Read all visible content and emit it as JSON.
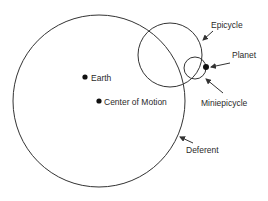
{
  "diagram": {
    "colors": {
      "line": "#333333",
      "dot": "#111111",
      "text": "#2a2a2a",
      "background": "#ffffff"
    },
    "circles": [
      {
        "name": "Deferent",
        "cx": 99,
        "cy": 101,
        "r": 86
      },
      {
        "name": "Epicycle",
        "cx": 170,
        "cy": 55,
        "r": 32
      },
      {
        "name": "Miniepicycle",
        "cx": 195,
        "cy": 68,
        "r": 11
      }
    ],
    "points": [
      {
        "name": "Earth",
        "x": 85,
        "y": 77,
        "label": "Earth"
      },
      {
        "name": "Center of Motion",
        "x": 99,
        "y": 101,
        "label": "Center of Motion"
      },
      {
        "name": "Planet",
        "x": 206,
        "y": 67
      }
    ],
    "labels": {
      "earth": "Earth",
      "center_of_motion": "Center of Motion",
      "epicycle": "Epicycle",
      "planet": "Planet",
      "miniepicycle": "Miniepicycle",
      "deferent": "Deferent"
    },
    "arrows": [
      {
        "label": "Epicycle",
        "from": [
          213,
          31
        ],
        "to": [
          203,
          40
        ]
      },
      {
        "label": "Planet",
        "from": [
          230,
          63
        ],
        "to": [
          211,
          67
        ]
      },
      {
        "label": "Miniepicycle",
        "from": [
          223,
          93
        ],
        "to": [
          206,
          79
        ]
      },
      {
        "label": "Deferent",
        "from": [
          193,
          143
        ],
        "to": [
          180,
          137
        ]
      }
    ]
  }
}
